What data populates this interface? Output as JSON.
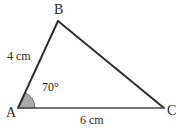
{
  "figure": {
    "background_color": "#ffffff",
    "stroke_color": "#2b2b2b",
    "base_stroke_color": "#4a4a4a",
    "angle_fill_color": "#a9a9a9",
    "angle_stroke_color": "#707070",
    "text_color": "#2b2b2b"
  },
  "vertices": {
    "a": {
      "label": "A",
      "x": 18,
      "y": 108
    },
    "b": {
      "label": "B",
      "x": 58,
      "y": 21
    },
    "c": {
      "label": "C",
      "x": 164,
      "y": 108
    }
  },
  "sides": {
    "ab": {
      "label": "4 cm",
      "length_value": 4,
      "unit": "cm"
    },
    "ac": {
      "label": "6 cm",
      "length_value": 6,
      "unit": "cm"
    }
  },
  "angles": {
    "at_a": {
      "label": "70°",
      "value": 70,
      "unit": "degrees",
      "marker": "filled-sector"
    }
  },
  "chart_data": {
    "type": "diagram",
    "shape": "triangle",
    "points": [
      {
        "name": "A",
        "x": 18,
        "y": 108
      },
      {
        "name": "B",
        "x": 58,
        "y": 21
      },
      {
        "name": "C",
        "x": 164,
        "y": 108
      }
    ],
    "edges": [
      {
        "from": "A",
        "to": "B",
        "label": "4 cm"
      },
      {
        "from": "B",
        "to": "C",
        "label": ""
      },
      {
        "from": "A",
        "to": "C",
        "label": "6 cm"
      }
    ],
    "angle_annotations": [
      {
        "at": "A",
        "label": "70°",
        "value": 70
      }
    ]
  }
}
